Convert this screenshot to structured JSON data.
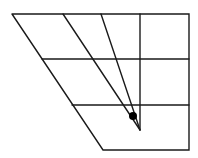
{
  "diagram": {
    "width": 198,
    "height": 158,
    "stroke_color": "#1a1a1a",
    "background": "#ffffff",
    "outline": [
      [
        12,
        14
      ],
      [
        189,
        14
      ],
      [
        189,
        150
      ],
      [
        103,
        150
      ],
      [
        12,
        14
      ]
    ],
    "horizontals": [
      {
        "x1": 42,
        "y1": 59,
        "x2": 189,
        "y2": 59
      },
      {
        "x1": 72,
        "y1": 105,
        "x2": 189,
        "y2": 105
      }
    ],
    "vertical": {
      "x1": 140,
      "y1": 14,
      "x2": 140,
      "y2": 130
    },
    "rays": [
      {
        "x1": 63,
        "y1": 14,
        "x2": 140,
        "y2": 130
      },
      {
        "x1": 101,
        "y1": 14,
        "x2": 140,
        "y2": 130
      }
    ],
    "dot": {
      "cx": 133,
      "cy": 116,
      "r": 4,
      "color": "#000000"
    }
  }
}
